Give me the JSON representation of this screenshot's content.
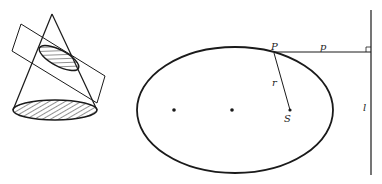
{
  "figure": {
    "left_panel": {
      "description": "cone cut by an oblique plane, elliptical cross-section and hatched base",
      "elements": [
        "cone",
        "cutting-plane",
        "elliptical-section",
        "circular-base"
      ]
    },
    "right_panel": {
      "description": "ellipse with foci and directrix",
      "labels": {
        "point_on_curve": "P",
        "perpendicular_distance": "p",
        "radius": "r",
        "focus": "S",
        "directrix": "l"
      }
    }
  },
  "colors": {
    "ink": "#1a1a1a",
    "background": "#ffffff"
  }
}
